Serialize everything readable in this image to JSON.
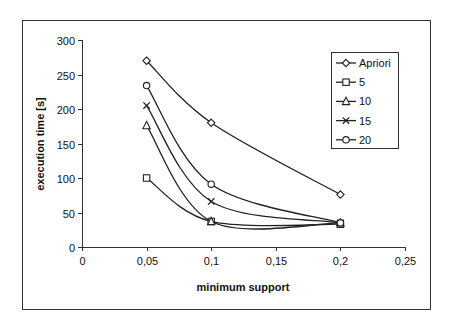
{
  "chart_data": {
    "type": "line",
    "title": "",
    "xlabel": "minimum support",
    "ylabel": "execution time [s]",
    "xlim": [
      0,
      0.25
    ],
    "ylim": [
      0,
      300
    ],
    "x_ticks": [
      0,
      0.05,
      0.1,
      0.15,
      0.2,
      0.25
    ],
    "x_tick_labels": [
      "0",
      "0,05",
      "0,1",
      "0,15",
      "0,2",
      "0,25"
    ],
    "y_ticks": [
      0,
      50,
      100,
      150,
      200,
      250,
      300
    ],
    "y_tick_labels": [
      "0",
      "50",
      "100",
      "150",
      "200",
      "250",
      "300"
    ],
    "grid": false,
    "smoothed": true,
    "legend_position": "top-right",
    "x": [
      0.05,
      0.1,
      0.2
    ],
    "series": [
      {
        "name": "Apriori",
        "marker": "diamond",
        "values": [
          270,
          180,
          76
        ]
      },
      {
        "name": "5",
        "marker": "square",
        "values": [
          100,
          37,
          33
        ]
      },
      {
        "name": "10",
        "marker": "triangle",
        "values": [
          176,
          37,
          35
        ]
      },
      {
        "name": "15",
        "marker": "x",
        "values": [
          205,
          66,
          35
        ]
      },
      {
        "name": "20",
        "marker": "circle",
        "values": [
          234,
          91,
          35
        ]
      }
    ]
  }
}
